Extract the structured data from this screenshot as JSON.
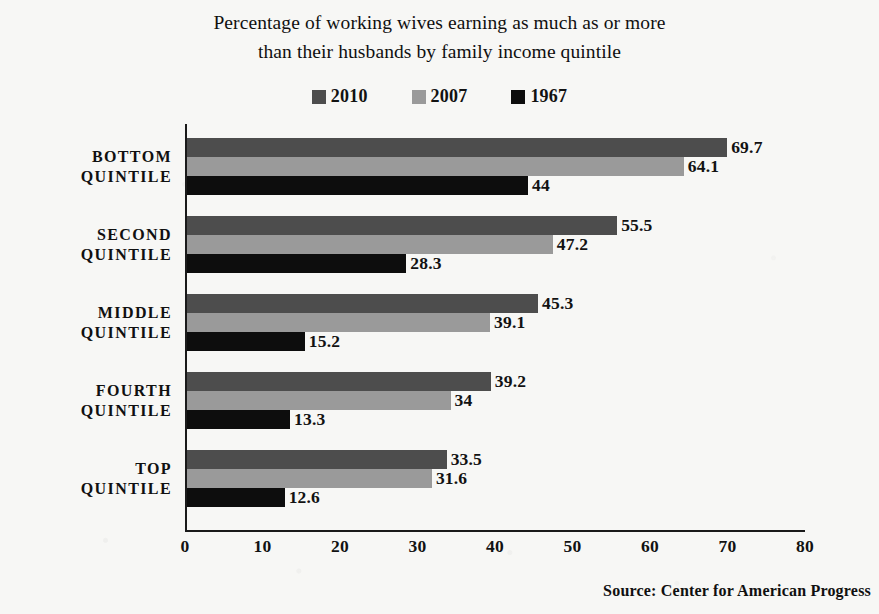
{
  "title": {
    "line1": "Percentage of working wives earning as much as or more",
    "line2": "than their husbands by family income quintile"
  },
  "source": "Source:  Center for American Progress",
  "colors": {
    "series_2010": "#4d4d4d",
    "series_2007": "#9a9a9a",
    "series_1967": "#0d0d0d",
    "axis": "#1a1a1a",
    "background": "#f7f7f5",
    "text": "#121212"
  },
  "chart_data": {
    "type": "bar",
    "orientation": "horizontal",
    "title": "Percentage of working wives earning as much as or more than their husbands by family income quintile",
    "xlabel": "",
    "ylabel": "",
    "xlim": [
      0,
      80
    ],
    "xticks": [
      0,
      10,
      20,
      30,
      40,
      50,
      60,
      70,
      80
    ],
    "grid": false,
    "legend_position": "top-center",
    "categories": [
      "BOTTOM QUINTILE",
      "SECOND QUINTILE",
      "MIDDLE QUINTILE",
      "FOURTH QUINTILE",
      "TOP QUINTILE"
    ],
    "category_lines": [
      [
        "BOTTOM",
        "QUINTILE"
      ],
      [
        "SECOND",
        "QUINTILE"
      ],
      [
        "MIDDLE",
        "QUINTILE"
      ],
      [
        "FOURTH",
        "QUINTILE"
      ],
      [
        "TOP",
        "QUINTILE"
      ]
    ],
    "series": [
      {
        "name": "2010",
        "color": "#4d4d4d",
        "values": [
          69.7,
          55.5,
          45.3,
          39.2,
          33.5
        ],
        "labels": [
          "69.7",
          "55.5",
          "45.3",
          "39.2",
          "33.5"
        ]
      },
      {
        "name": "2007",
        "color": "#9a9a9a",
        "values": [
          64.1,
          47.2,
          39.1,
          34,
          31.6
        ],
        "labels": [
          "64.1",
          "47.2",
          "39.1",
          "34",
          "31.6"
        ]
      },
      {
        "name": "1967",
        "color": "#0d0d0d",
        "values": [
          44,
          28.3,
          15.2,
          13.3,
          12.6
        ],
        "labels": [
          "44",
          "28.3",
          "15.2",
          "13.3",
          "12.6"
        ]
      }
    ]
  }
}
